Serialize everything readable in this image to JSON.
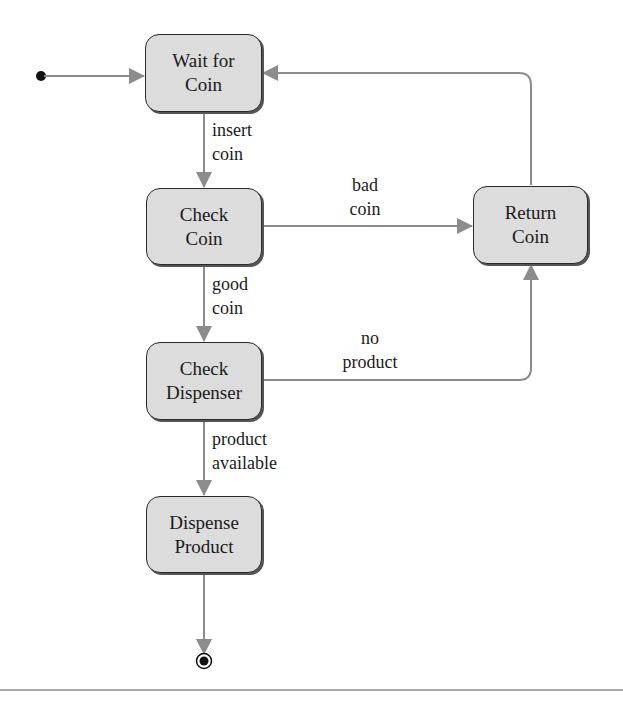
{
  "diagram": {
    "type": "UML state machine",
    "colors": {
      "box_fill": "#dcdcdc",
      "box_border": "#2a2a2a",
      "edge": "#8c8c8c",
      "text": "#1a1a1a",
      "rule": "#a8a8a8"
    },
    "initial_state": {
      "x": 40,
      "y": 76
    },
    "final_state": {
      "x": 204,
      "y": 663
    },
    "states": [
      {
        "id": "wait_for_coin",
        "lines": [
          "Wait for",
          "Coin"
        ],
        "x": 145,
        "y": 34,
        "w": 117,
        "h": 78
      },
      {
        "id": "check_coin",
        "lines": [
          "Check",
          "Coin"
        ],
        "x": 146,
        "y": 188,
        "w": 116,
        "h": 77
      },
      {
        "id": "check_dispenser",
        "lines": [
          "Check",
          "Dispenser"
        ],
        "x": 146,
        "y": 342,
        "w": 116,
        "h": 78
      },
      {
        "id": "dispense_product",
        "lines": [
          "Dispense",
          "Product"
        ],
        "x": 146,
        "y": 496,
        "w": 116,
        "h": 77
      },
      {
        "id": "return_coin",
        "lines": [
          "Return",
          "Coin"
        ],
        "x": 473,
        "y": 186,
        "w": 115,
        "h": 78
      }
    ],
    "transitions": [
      {
        "from": "initial",
        "to": "wait_for_coin",
        "label": []
      },
      {
        "from": "wait_for_coin",
        "to": "check_coin",
        "label": [
          "insert",
          "coin"
        ]
      },
      {
        "from": "check_coin",
        "to": "return_coin",
        "label": [
          "bad",
          "coin"
        ]
      },
      {
        "from": "check_coin",
        "to": "check_dispenser",
        "label": [
          "good",
          "coin"
        ]
      },
      {
        "from": "check_dispenser",
        "to": "return_coin",
        "label": [
          "no",
          "product"
        ]
      },
      {
        "from": "check_dispenser",
        "to": "dispense_product",
        "label": [
          "product",
          "available"
        ]
      },
      {
        "from": "return_coin",
        "to": "wait_for_coin",
        "label": []
      },
      {
        "from": "dispense_product",
        "to": "final",
        "label": []
      }
    ]
  }
}
